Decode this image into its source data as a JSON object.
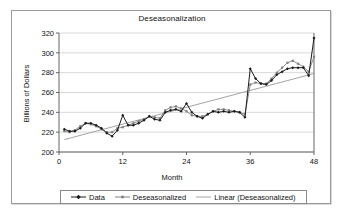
{
  "chart_data": {
    "type": "line",
    "title": "Deseasonalization",
    "xlabel": "Month",
    "ylabel": "Billions of Dollars",
    "xlim": [
      0,
      48
    ],
    "ylim": [
      200,
      320
    ],
    "xticks": [
      0,
      12,
      24,
      36,
      48
    ],
    "yticks": [
      200,
      220,
      240,
      260,
      280,
      300,
      320
    ],
    "grid": "horizontal",
    "legend_position": "bottom",
    "colors": {
      "data": "#1a1a1a",
      "deseasonalized": "#808080",
      "trend": "#9a9a9a",
      "gridline": "#c8c8c8",
      "axis": "#555555",
      "frame": "#9a9a9a"
    },
    "x": [
      1,
      2,
      3,
      4,
      5,
      6,
      7,
      8,
      9,
      10,
      11,
      12,
      13,
      14,
      15,
      16,
      17,
      18,
      19,
      20,
      21,
      22,
      23,
      24,
      25,
      26,
      27,
      28,
      29,
      30,
      31,
      32,
      33,
      34,
      35,
      36,
      37,
      38,
      39,
      40,
      41,
      42,
      43,
      44,
      45,
      46,
      47,
      48
    ],
    "series": [
      {
        "name": "Data",
        "marker": "diamond",
        "values": [
          223,
          221,
          221,
          224,
          229,
          229,
          227,
          224,
          219,
          216,
          222,
          237,
          227,
          227,
          229,
          232,
          236,
          233,
          232,
          240,
          242,
          243,
          241,
          249,
          240,
          236,
          234,
          238,
          241,
          240,
          241,
          240,
          241,
          240,
          235,
          284,
          274,
          269,
          268,
          272,
          278,
          281,
          284,
          285,
          285,
          285,
          277,
          315
        ]
      },
      {
        "name": "Deseasonalized",
        "marker": "square",
        "values": [
          221,
          220,
          222,
          226,
          229,
          228,
          226,
          223,
          220,
          220,
          224,
          225,
          227,
          229,
          231,
          233,
          236,
          235,
          234,
          242,
          245,
          246,
          244,
          241,
          237,
          236,
          236,
          238,
          241,
          243,
          243,
          242,
          241,
          240,
          238,
          268,
          270,
          269,
          269,
          274,
          280,
          285,
          290,
          292,
          289,
          286,
          281,
          296
        ]
      },
      {
        "name": "Linear (Deseasonalized)",
        "marker": "none",
        "values": [
          212.5,
          213.9,
          215.3,
          216.7,
          218.1,
          219.6,
          221.0,
          222.4,
          223.8,
          225.2,
          226.6,
          228.1,
          229.5,
          230.9,
          232.3,
          233.7,
          235.1,
          236.6,
          238.0,
          239.4,
          240.8,
          242.2,
          243.6,
          245.1,
          246.5,
          247.9,
          249.3,
          250.7,
          252.1,
          253.6,
          255.0,
          256.4,
          257.8,
          259.2,
          260.6,
          262.1,
          263.5,
          264.9,
          266.3,
          267.7,
          269.1,
          270.6,
          272.0,
          273.4,
          274.8,
          276.2,
          277.6,
          279.1
        ]
      }
    ]
  },
  "legend": {
    "items": [
      {
        "label": "Data",
        "key": "data"
      },
      {
        "label": "Deseasonalized",
        "key": "deseasonalized"
      },
      {
        "label": "Linear (Deseasonalized)",
        "key": "trend"
      }
    ]
  }
}
